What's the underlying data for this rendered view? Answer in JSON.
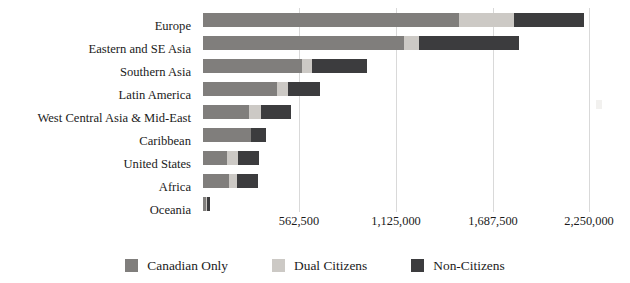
{
  "chart_data": {
    "type": "bar",
    "orientation": "horizontal",
    "stacked": true,
    "title": "",
    "subtitle": "",
    "xlabel": "",
    "ylabel": "",
    "grid": true,
    "legend_position": "bottom",
    "xlim": [
      0,
      2250000
    ],
    "xticks": [
      562500,
      1125000,
      1687500,
      2250000
    ],
    "xtick_labels": [
      "562,500",
      "1,125,000",
      "1,687,500",
      "2,250,000"
    ],
    "categories": [
      "Europe",
      "Eastern and SE Asia",
      "Southern Asia",
      "Latin America",
      "West Central Asia & Mid-East",
      "Caribbean",
      "United States",
      "Africa",
      "Oceania"
    ],
    "series": [
      {
        "name": "Canadian Only",
        "color": "#807e7c",
        "values": [
          1488000,
          1167000,
          578000,
          432000,
          268000,
          280000,
          140000,
          152000,
          18000
        ]
      },
      {
        "name": "Dual Citizens",
        "color": "#ccc9c5",
        "values": [
          321000,
          88000,
          58000,
          64000,
          70000,
          0,
          64000,
          47000,
          6000
        ]
      },
      {
        "name": "Non-Citizens",
        "color": "#3c3c3e",
        "values": [
          408000,
          583000,
          315000,
          187000,
          175000,
          88000,
          123000,
          123000,
          18000
        ]
      }
    ],
    "totals": [
      2217000,
      1838000,
      951000,
      683000,
      513000,
      368000,
      327000,
      322000,
      42000
    ]
  },
  "legend": {
    "items": [
      {
        "label": "Canadian Only",
        "color": "#807e7c",
        "swatch": "legend-swatch-canadian-only"
      },
      {
        "label": "Dual Citizens",
        "color": "#ccc9c5",
        "swatch": "legend-swatch-dual-citizens"
      },
      {
        "label": "Non-Citizens",
        "color": "#3c3c3e",
        "swatch": "legend-swatch-non-citizens"
      }
    ]
  }
}
